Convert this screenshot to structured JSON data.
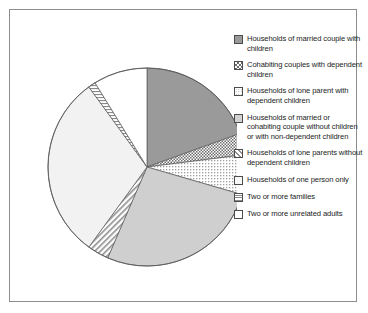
{
  "chart_data": {
    "type": "pie",
    "title": "",
    "subtitle": "",
    "xlabel": "",
    "ylabel": "",
    "grid": false,
    "legend_position": "right",
    "center": {
      "x": 137,
      "y": 157
    },
    "radius": 99,
    "start_angle_deg": -90,
    "categories": [
      "Households of married couple with children",
      "Cohabiting couples with dependent children",
      "Households of lone parent with dependent children",
      "Households of married or cohabiting couple without children or with non-dependent children",
      "Households of lone parents without dependent children",
      "Households of one person only",
      "Two or more families",
      "Two or more unrelated adults"
    ],
    "values": [
      19.5,
      3.5,
      6.5,
      27.0,
      3.5,
      30.0,
      1.2,
      8.8
    ],
    "colors": [
      "#9a9a9a",
      "#d4d4d4",
      "#e2e2e2",
      "#cfcfcf",
      "#e0e0e0",
      "#f2f2f2",
      "#e6e6e6",
      "#ffffff"
    ],
    "patterns": [
      "solid",
      "checker-dense",
      "dots",
      "solid",
      "diagonal-hatch",
      "solid",
      "horizontal-lines",
      "solid"
    ]
  },
  "legend": {
    "items": [
      {
        "label": "Households of married couple with children",
        "swatch": "swatch-solid-dark-gray",
        "pattern": "solid",
        "color": "#9a9a9a"
      },
      {
        "label": "Cohabiting couples with dependent children",
        "swatch": "swatch-checker-dense",
        "pattern": "checker-dense",
        "color": "#d4d4d4"
      },
      {
        "label": "Households of lone parent with dependent children",
        "swatch": "swatch-dots",
        "pattern": "dots",
        "color": "#e2e2e2"
      },
      {
        "label": "Households of married or cohabiting couple without children or with non-dependent children",
        "swatch": "swatch-solid-mid-gray",
        "pattern": "solid",
        "color": "#cfcfcf"
      },
      {
        "label": "Households of lone parents without dependent children",
        "swatch": "swatch-diagonal-hatch",
        "pattern": "diagonal-hatch",
        "color": "#e0e0e0"
      },
      {
        "label": "Households of one person only",
        "swatch": "swatch-solid-white",
        "pattern": "solid",
        "color": "#f7f7f7"
      },
      {
        "label": "Two or more families",
        "swatch": "swatch-horizontal-lines",
        "pattern": "horizontal-lines",
        "color": "#e6e6e6"
      },
      {
        "label": "Two or more unrelated adults",
        "swatch": "swatch-solid-plain-white",
        "pattern": "solid",
        "color": "#ffffff"
      }
    ]
  }
}
